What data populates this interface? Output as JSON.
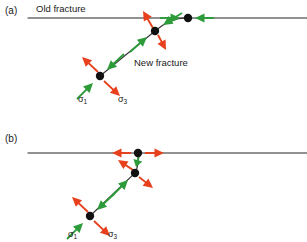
{
  "figure": {
    "width": 307,
    "height": 242,
    "background": "#ffffff",
    "colors": {
      "compression_arrow": "#2E9B3A",
      "tension_arrow": "#E8401C",
      "fracture_line": "#6E6E6E",
      "new_fracture_line": "#3A3A3A",
      "node_dot": "#111111",
      "text": "#1a1a1a"
    }
  },
  "panels": [
    {
      "id": "a",
      "label": "(a)",
      "label_pos": {
        "x": 5,
        "y": 5
      },
      "old_fracture_label": "Old fracture",
      "old_fracture_label_pos": {
        "x": 36,
        "y": 3
      },
      "new_fracture_label": "New fracture",
      "new_fracture_label_pos": {
        "x": 134,
        "y": 57
      },
      "old_fracture_line": {
        "x1": 28,
        "y1": 18,
        "x2": 307,
        "y2": 18
      },
      "new_fracture_path": "M 100 76 L 155 31 Q 172 17 188 18",
      "nodes": [
        {
          "name": "lower-node",
          "x": 100,
          "y": 76,
          "r": 4.2
        },
        {
          "name": "middle-node",
          "x": 155,
          "y": 31,
          "r": 4.2
        },
        {
          "name": "upper-node",
          "x": 188,
          "y": 18,
          "r": 4.2
        }
      ],
      "stress_labels": [
        {
          "symbol": "σ",
          "subscript": "1",
          "x": 78,
          "y": 94,
          "name": "sigma-1-label"
        },
        {
          "symbol": "σ",
          "subscript": "3",
          "x": 118,
          "y": 94,
          "name": "sigma-3-label"
        }
      ],
      "arrows": [
        {
          "name": "compression-arrow-lower-ne",
          "color": "compression",
          "tail_x": 124,
          "tail_y": 54,
          "tip_x": 107,
          "tip_y": 70
        },
        {
          "name": "compression-arrow-lower-sw",
          "color": "compression",
          "tail_x": 77,
          "tail_y": 99,
          "tip_x": 93,
          "tip_y": 83
        },
        {
          "name": "tension-arrow-lower-nw",
          "color": "tension",
          "tail_x": 98,
          "tail_y": 72,
          "tip_x": 82,
          "tip_y": 57
        },
        {
          "name": "tension-arrow-lower-se",
          "color": "tension",
          "tail_x": 104,
          "tail_y": 81,
          "tip_x": 120,
          "tip_y": 96
        },
        {
          "name": "compression-arrow-middle-ne",
          "color": "compression",
          "tail_x": 182,
          "tail_y": 13,
          "tip_x": 163,
          "tip_y": 25
        },
        {
          "name": "compression-arrow-middle-sw",
          "color": "compression",
          "tail_x": 130,
          "tail_y": 52,
          "tip_x": 147,
          "tip_y": 37
        },
        {
          "name": "tension-arrow-middle-nw",
          "color": "tension",
          "tail_x": 153,
          "tail_y": 28,
          "tip_x": 143,
          "tip_y": 11
        },
        {
          "name": "tension-arrow-middle-se",
          "color": "tension",
          "tail_x": 158,
          "tail_y": 35,
          "tip_x": 166,
          "tip_y": 50
        },
        {
          "name": "compression-arrow-upper-left",
          "color": "compression",
          "tail_x": 160,
          "tail_y": 18,
          "tip_x": 180,
          "tip_y": 18
        },
        {
          "name": "compression-arrow-upper-right",
          "color": "compression",
          "tail_x": 214,
          "tail_y": 18,
          "tip_x": 195,
          "tip_y": 18
        }
      ]
    },
    {
      "id": "b",
      "label": "(b)",
      "label_pos": {
        "x": 5,
        "y": 133
      },
      "old_fracture_line": {
        "x1": 28,
        "y1": 153,
        "x2": 307,
        "y2": 153
      },
      "new_fracture_path": "M 90 216 L 135 173 Q 139 166 138 153",
      "nodes": [
        {
          "name": "lower-node",
          "x": 90,
          "y": 216,
          "r": 4.2
        },
        {
          "name": "middle-node",
          "x": 135,
          "y": 173,
          "r": 4.2
        },
        {
          "name": "upper-node",
          "x": 138,
          "y": 153,
          "r": 4.2
        }
      ],
      "stress_labels": [
        {
          "symbol": "σ",
          "subscript": "1",
          "x": 68,
          "y": 229,
          "name": "sigma-1-label"
        },
        {
          "symbol": "σ",
          "subscript": "3",
          "x": 108,
          "y": 229,
          "name": "sigma-3-label"
        }
      ],
      "arrows": [
        {
          "name": "compression-arrow-lower-ne",
          "color": "compression",
          "tail_x": 114,
          "tail_y": 194,
          "tip_x": 97,
          "tip_y": 210
        },
        {
          "name": "compression-arrow-lower-sw",
          "color": "compression",
          "tail_x": 67,
          "tail_y": 239,
          "tip_x": 83,
          "tip_y": 223
        },
        {
          "name": "tension-arrow-lower-nw",
          "color": "tension",
          "tail_x": 88,
          "tail_y": 212,
          "tip_x": 72,
          "tip_y": 197
        },
        {
          "name": "tension-arrow-lower-se",
          "color": "tension",
          "tail_x": 94,
          "tail_y": 221,
          "tip_x": 110,
          "tip_y": 236
        },
        {
          "name": "compression-arrow-middle-n",
          "color": "compression",
          "tail_x": 139,
          "tail_y": 156,
          "tip_x": 136,
          "tip_y": 167
        },
        {
          "name": "compression-arrow-middle-sw",
          "color": "compression",
          "tail_x": 112,
          "tail_y": 196,
          "tip_x": 128,
          "tip_y": 180
        },
        {
          "name": "tension-arrow-middle-nw",
          "color": "tension",
          "tail_x": 133,
          "tail_y": 170,
          "tip_x": 118,
          "tip_y": 160
        },
        {
          "name": "tension-arrow-middle-se",
          "color": "tension",
          "tail_x": 139,
          "tail_y": 177,
          "tip_x": 153,
          "tip_y": 188
        },
        {
          "name": "tension-arrow-upper-left",
          "color": "tension",
          "tail_x": 131,
          "tail_y": 153,
          "tip_x": 112,
          "tip_y": 153
        },
        {
          "name": "tension-arrow-upper-right",
          "color": "tension",
          "tail_x": 145,
          "tail_y": 153,
          "tip_x": 164,
          "tip_y": 153
        }
      ]
    }
  ]
}
